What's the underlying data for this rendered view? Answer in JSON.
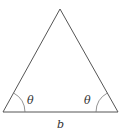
{
  "diagram": {
    "type": "isosceles-triangle",
    "vertices": {
      "apex": [
        60,
        9
      ],
      "left": [
        3,
        112
      ],
      "right": [
        118,
        112
      ]
    },
    "angle_labels": [
      {
        "text": "θ",
        "position": "left-base"
      },
      {
        "text": "θ",
        "position": "right-base"
      }
    ],
    "base_label": "b",
    "colors": {
      "line": "#555555",
      "arc": "#777777",
      "text": "#333333"
    }
  }
}
